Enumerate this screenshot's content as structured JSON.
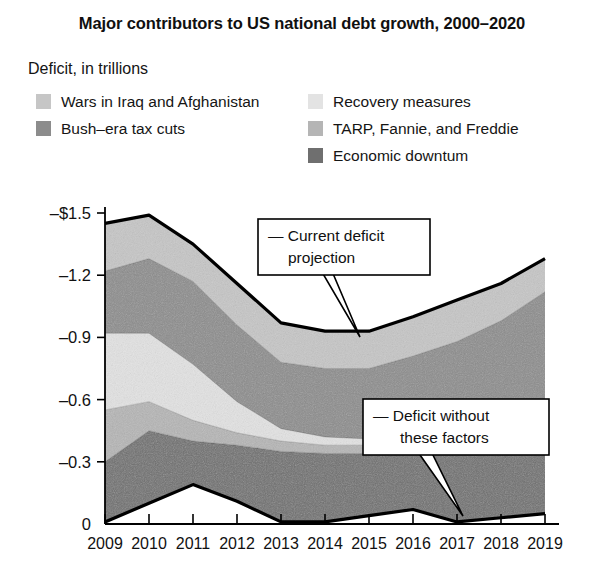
{
  "title": "Major contributors to US national debt growth, 2000–2020",
  "axis_caption": "Deficit, in trillions",
  "legend": {
    "left": [
      {
        "label": "Wars in Iraq and Afghanistan",
        "color": "#c6c6c6",
        "key": "wars"
      },
      {
        "label": "Bush–era tax cuts",
        "color": "#8c8c8c",
        "key": "bush_tax_cuts"
      }
    ],
    "right": [
      {
        "label": "Recovery measures",
        "color": "#e3e3e3",
        "key": "recovery"
      },
      {
        "label": "TARP, Fannie, and Freddie",
        "color": "#b5b5b5",
        "key": "tarp"
      },
      {
        "label": "Economic downtum",
        "color": "#6f6f6f",
        "key": "downturn"
      }
    ]
  },
  "callouts": [
    {
      "name": "current-deficit-projection",
      "lines": [
        "— Current deficit",
        "projection"
      ]
    },
    {
      "name": "deficit-without-these-factors",
      "lines": [
        "— Deficit without",
        "these factors"
      ]
    }
  ],
  "chart_data": {
    "type": "area",
    "title": "Major contributors to US national debt growth, 2000–2020",
    "subtitle": "Deficit, in trillions",
    "xlabel": "",
    "ylabel": "Deficit, in trillions",
    "categories": [
      "2009",
      "2010",
      "2011",
      "2012",
      "2013",
      "2014",
      "2015",
      "2016",
      "2017",
      "2018",
      "2019"
    ],
    "ytick_labels": [
      "–$1.5",
      "–1.2",
      "–0.9",
      "–0.6",
      "–0.3",
      "0"
    ],
    "ytick_values": [
      -1.5,
      -1.2,
      -0.9,
      -0.6,
      -0.3,
      0
    ],
    "ylim": [
      -1.5,
      0
    ],
    "grid": false,
    "legend_position": "top",
    "note": "Values are negative (deficit). Series are stacked from the baseline 'deficit without these factors' upward (downward in magnitude).",
    "baseline_deficit_without_factors": [
      -0.01,
      -0.1,
      -0.19,
      -0.11,
      -0.01,
      -0.01,
      -0.04,
      -0.07,
      -0.01,
      -0.03,
      -0.05
    ],
    "total_current_deficit_projection": [
      -1.45,
      -1.49,
      -1.35,
      -1.16,
      -0.97,
      -0.93,
      -0.93,
      -1.0,
      -1.08,
      -1.16,
      -1.28
    ],
    "series": [
      {
        "name": "Economic downtum",
        "key": "downturn",
        "color": "#6f6f6f",
        "values": [
          -0.29,
          -0.35,
          -0.21,
          -0.27,
          -0.34,
          -0.33,
          -0.3,
          -0.3,
          -0.35,
          -0.34,
          -0.3
        ]
      },
      {
        "name": "TARP, Fannie, and Freddie",
        "key": "tarp",
        "color": "#b5b5b5",
        "values": [
          -0.25,
          -0.14,
          -0.1,
          -0.06,
          -0.05,
          -0.04,
          -0.04,
          -0.04,
          -0.04,
          -0.04,
          -0.05
        ]
      },
      {
        "name": "Recovery measures",
        "key": "recovery",
        "color": "#e3e3e3",
        "values": [
          -0.37,
          -0.33,
          -0.27,
          -0.15,
          -0.06,
          -0.04,
          -0.03,
          -0.03,
          -0.03,
          -0.03,
          -0.03
        ]
      },
      {
        "name": "Bush–era tax cuts",
        "key": "bush_tax_cuts",
        "color": "#8c8c8c",
        "values": [
          -0.3,
          -0.36,
          -0.4,
          -0.37,
          -0.32,
          -0.33,
          -0.34,
          -0.37,
          -0.45,
          -0.54,
          -0.69
        ]
      },
      {
        "name": "Wars in Iraq and Afghanistan",
        "key": "wars",
        "color": "#c6c6c6",
        "values": [
          -0.23,
          -0.21,
          -0.18,
          -0.2,
          -0.19,
          -0.18,
          -0.18,
          -0.19,
          -0.2,
          -0.18,
          -0.16
        ]
      }
    ]
  }
}
